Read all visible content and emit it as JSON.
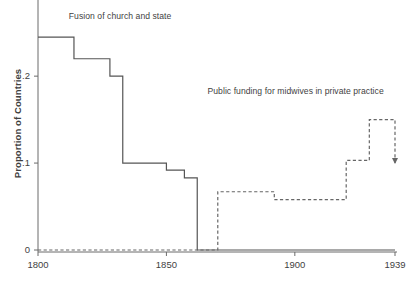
{
  "chart_data": {
    "type": "line",
    "title": "",
    "xlabel": "",
    "ylabel": "Proportion of Countries",
    "xlim": [
      1800,
      1939
    ],
    "ylim": [
      0,
      0.26
    ],
    "grid": false,
    "legend_position": "inline-annotations",
    "xticks": [
      1800,
      1850,
      1900,
      1939
    ],
    "xtick_labels": [
      "1800",
      "1850",
      "1900",
      "1939"
    ],
    "yticks": [
      0,
      0.1,
      0.2
    ],
    "ytick_labels": [
      "0",
      ".1",
      ".2"
    ],
    "series": [
      {
        "name": "Fusion of church and state",
        "style": "solid",
        "color": "#555555",
        "step": "post",
        "x": [
          1800,
          1814,
          1814,
          1828,
          1828,
          1833,
          1833,
          1850,
          1850,
          1857,
          1857,
          1862,
          1862,
          1939
        ],
        "y": [
          0.245,
          0.245,
          0.22,
          0.22,
          0.2,
          0.2,
          0.1,
          0.1,
          0.092,
          0.092,
          0.083,
          0.083,
          0.0,
          0.0
        ]
      },
      {
        "name": "Public funding for midwives in private practice",
        "style": "dashed",
        "color": "#666666",
        "step": "post",
        "arrow_end": true,
        "x": [
          1800,
          1870,
          1870,
          1892,
          1892,
          1920,
          1920,
          1929,
          1929,
          1939,
          1939
        ],
        "y": [
          0.0,
          0.0,
          0.067,
          0.067,
          0.058,
          0.058,
          0.103,
          0.103,
          0.15,
          0.15,
          0.1
        ]
      }
    ],
    "annotations": [
      {
        "text": "Fusion of church and state",
        "x": 1812,
        "y": 0.268
      },
      {
        "text": "Public funding for midwives in private practice",
        "x": 1866,
        "y": 0.182
      }
    ]
  },
  "axis": {
    "y_title": "Proportion of Countries"
  },
  "colors": {
    "axis": "#6b6b6b",
    "solid_series": "#555555",
    "dashed_series": "#666666",
    "text": "#3f3f3f"
  }
}
